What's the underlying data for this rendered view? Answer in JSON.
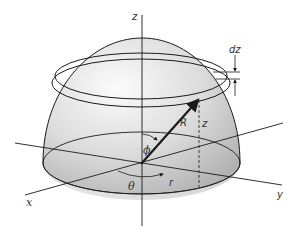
{
  "figure": {
    "labels": {
      "z_axis": "z",
      "x_axis": "x",
      "y_axis": "y",
      "radius": "R",
      "height": "z",
      "thickness": "dz",
      "polar_angle": "ϕ",
      "azimuth_angle": "θ",
      "cyl_radius": "r"
    },
    "colors": {
      "dome_light": "#f4f4f4",
      "dome_dark": "#b8b8b8",
      "line": "#1a1a1a"
    }
  }
}
